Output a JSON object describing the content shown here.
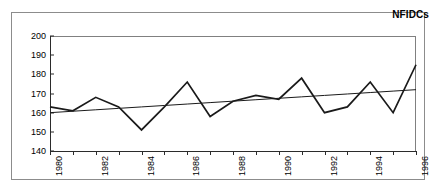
{
  "chart_data": {
    "type": "line",
    "title": "NFIDCs",
    "xlabel": "",
    "ylabel": "",
    "xlim": [
      1980,
      1996
    ],
    "ylim": [
      140,
      200
    ],
    "ytick_labels": [
      "200",
      "190",
      "180",
      "170",
      "160",
      "150",
      "140"
    ],
    "ytick_values": [
      200,
      190,
      180,
      170,
      160,
      150,
      140
    ],
    "xtick_labels": [
      "1980",
      "1982",
      "1984",
      "1986",
      "1988",
      "1990",
      "1992",
      "1994",
      "1996"
    ],
    "xtick_values": [
      1980,
      1982,
      1984,
      1986,
      1988,
      1990,
      1992,
      1994,
      1996
    ],
    "x": [
      1980,
      1981,
      1982,
      1983,
      1984,
      1985,
      1986,
      1987,
      1988,
      1989,
      1990,
      1991,
      1992,
      1993,
      1994,
      1995,
      1996
    ],
    "grid": false,
    "legend": "none",
    "series": [
      {
        "name": "NFIDCs",
        "kind": "data-line",
        "color": "#1a1a1a",
        "values": [
          163,
          161,
          168,
          163,
          151,
          163,
          176,
          158,
          166,
          169,
          167,
          178,
          160,
          163,
          176,
          160,
          185
        ]
      },
      {
        "name": "Trend",
        "kind": "trend-line",
        "color": "#1a1a1a",
        "values": [
          160.0,
          160.75,
          161.5,
          162.25,
          163.0,
          163.75,
          164.5,
          165.25,
          166.0,
          166.75,
          167.5,
          168.25,
          169.0,
          169.75,
          170.5,
          171.25,
          172.0
        ]
      }
    ]
  },
  "colors": {
    "frame": "#8c8c8c",
    "axis": "#2b2b2b",
    "series": "#1a1a1a",
    "background": "#ffffff"
  }
}
